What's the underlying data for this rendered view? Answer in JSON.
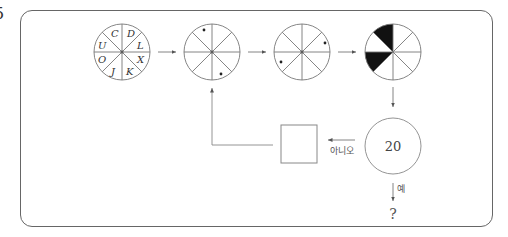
{
  "problem": {
    "number": "5"
  },
  "diagram": {
    "wheel_1": {
      "type": "lettered-wheel",
      "sectors": 8,
      "letters_clockwise_from_top_right": [
        "D",
        "L",
        "X",
        "K",
        "J",
        "O",
        "U",
        "C"
      ]
    },
    "wheel_2": {
      "type": "dotted-wheel",
      "dots": [
        "upper-left outer sector",
        "lower-right outer sector"
      ]
    },
    "wheel_3": {
      "type": "dotted-wheel",
      "dots": [
        "right upper sector",
        "left lower sector"
      ]
    },
    "wheel_4": {
      "type": "shaded-wheel",
      "shaded_sectors": [
        "top-left (upper)",
        "left (lower)"
      ]
    },
    "decision": {
      "value": "20",
      "no_label": "아니오",
      "yes_label": "예"
    },
    "process_box": {
      "label": ""
    },
    "result": {
      "text": "?"
    }
  }
}
